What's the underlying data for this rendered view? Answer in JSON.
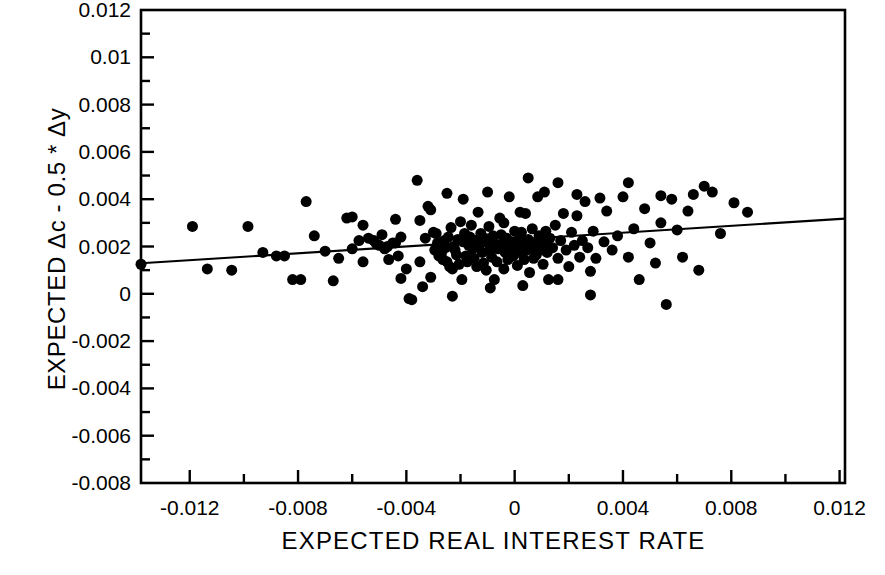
{
  "chart_data": {
    "type": "scatter",
    "title": "",
    "xlabel": "EXPECTED REAL INTEREST RATE",
    "ylabel": "EXPECTED Δc - 0.5 * Δy",
    "xlim": [
      -0.0138,
      0.0122
    ],
    "ylim": [
      -0.008,
      0.012
    ],
    "xticks": [
      -0.012,
      -0.008,
      -0.004,
      0,
      0.004,
      0.008,
      0.012
    ],
    "xticklabels": [
      "-0.012",
      "-0.008",
      "-0.004",
      "0",
      "0.004",
      "0.008",
      "0.012"
    ],
    "xtick_minor_step": 0.002,
    "yticks": [
      0.012,
      0.01,
      0.008,
      0.006,
      0.004,
      0.002,
      0,
      -0.002,
      -0.004,
      -0.006,
      -0.008
    ],
    "yticklabels": [
      "0.012",
      "0.01",
      "0.008",
      "0.006",
      "0.004",
      "0.002",
      "0",
      "-0.002",
      "-0.004",
      "-0.006",
      "-0.008"
    ],
    "ytick_minor_step": 0.001,
    "grid": false,
    "legend": null,
    "marker": {
      "shape": "circle",
      "color": "#000000",
      "size_px": 11
    },
    "frame_color": "#000000",
    "background": "#ffffff",
    "fit_line": {
      "label": "regression line",
      "color": "#000000",
      "slope": 0.0726,
      "intercept": 0.00229,
      "x_start": -0.0138,
      "y_start": 0.00129,
      "x_end": 0.0122,
      "y_end": 0.00318
    },
    "points": [
      [
        -0.0138,
        0.00125
      ],
      [
        -0.0119,
        0.00285
      ],
      [
        -0.01135,
        0.00105
      ],
      [
        -0.01045,
        0.001
      ],
      [
        -0.00985,
        0.00285
      ],
      [
        -0.0093,
        0.00175
      ],
      [
        -0.0088,
        0.0016
      ],
      [
        -0.0085,
        0.0016
      ],
      [
        -0.0082,
        0.0006
      ],
      [
        -0.0079,
        0.0006
      ],
      [
        -0.0077,
        0.0039
      ],
      [
        -0.0074,
        0.00245
      ],
      [
        -0.007,
        0.0018
      ],
      [
        -0.0067,
        0.00055
      ],
      [
        -0.0065,
        0.0015
      ],
      [
        -0.0062,
        0.0032
      ],
      [
        -0.006,
        0.00325
      ],
      [
        -0.00575,
        0.00225
      ],
      [
        -0.0056,
        0.00135
      ],
      [
        -0.0054,
        0.00235
      ],
      [
        -0.0052,
        0.00225
      ],
      [
        -0.0051,
        0.0021
      ],
      [
        -0.005,
        0.00205
      ],
      [
        -0.0049,
        0.0025
      ],
      [
        -0.0048,
        0.0019
      ],
      [
        -0.0047,
        0.002
      ],
      [
        -0.00465,
        0.00145
      ],
      [
        -0.0045,
        0.00215
      ],
      [
        -0.0044,
        0.00215
      ],
      [
        -0.0043,
        0.0016
      ],
      [
        -0.0042,
        0.00065
      ],
      [
        -0.004,
        0.00105
      ],
      [
        -0.0039,
        -0.0002
      ],
      [
        -0.0038,
        -0.00025
      ],
      [
        -0.0036,
        0.0048
      ],
      [
        -0.0035,
        0.00135
      ],
      [
        -0.0034,
        0.0003
      ],
      [
        -0.0033,
        0.00235
      ],
      [
        -0.0032,
        0.0037
      ],
      [
        -0.0031,
        0.00355
      ],
      [
        -0.003,
        0.0026
      ],
      [
        -0.00295,
        0.00185
      ],
      [
        -0.0029,
        0.00255
      ],
      [
        -0.00285,
        0.00215
      ],
      [
        -0.0028,
        0.0016
      ],
      [
        -0.00275,
        0.00205
      ],
      [
        -0.0027,
        0.00175
      ],
      [
        -0.00265,
        0.00145
      ],
      [
        -0.0026,
        0.00225
      ],
      [
        -0.00255,
        0.00195
      ],
      [
        -0.0025,
        0.00135
      ],
      [
        -0.00245,
        0.0024
      ],
      [
        -0.0024,
        0.00115
      ],
      [
        -0.00235,
        0.0028
      ],
      [
        -0.0023,
        0.00105
      ],
      [
        -0.00225,
        0.002
      ],
      [
        -0.0022,
        0.00185
      ],
      [
        -0.00215,
        0.00165
      ],
      [
        -0.0021,
        0.0023
      ],
      [
        -0.00205,
        0.00125
      ],
      [
        -0.002,
        0.00305
      ],
      [
        -0.00195,
        0.0006
      ],
      [
        -0.0019,
        0.0022
      ],
      [
        -0.00185,
        0.00255
      ],
      [
        -0.0018,
        0.0016
      ],
      [
        -0.00175,
        0.00135
      ],
      [
        -0.0017,
        0.00205
      ],
      [
        -0.00165,
        0.0024
      ],
      [
        -0.0016,
        0.0029
      ],
      [
        -0.00155,
        0.0019
      ],
      [
        -0.0015,
        0.0015
      ],
      [
        -0.00145,
        0.00225
      ],
      [
        -0.0014,
        0.00115
      ],
      [
        -0.00135,
        0.00345
      ],
      [
        -0.0013,
        0.00205
      ],
      [
        -0.00125,
        0.00255
      ],
      [
        -0.0012,
        0.00175
      ],
      [
        -0.00115,
        0.0013
      ],
      [
        -0.0011,
        0.00235
      ],
      [
        -0.00105,
        0.001
      ],
      [
        -0.001,
        0.00215
      ],
      [
        -0.00095,
        0.00285
      ],
      [
        -0.0009,
        0.00185
      ],
      [
        -0.00085,
        0.00155
      ],
      [
        -0.0008,
        0.00245
      ],
      [
        -0.00075,
        0.0006
      ],
      [
        -0.0007,
        0.0021
      ],
      [
        -0.00065,
        0.00135
      ],
      [
        -0.0006,
        0.0019
      ],
      [
        -0.00055,
        0.0032
      ],
      [
        -0.0005,
        0.0025
      ],
      [
        -0.00045,
        0.00205
      ],
      [
        -0.0004,
        0.00105
      ],
      [
        -0.00035,
        0.00175
      ],
      [
        -0.0003,
        0.00235
      ],
      [
        -0.00025,
        0.00145
      ],
      [
        -0.0002,
        0.0041
      ],
      [
        -0.00015,
        0.00195
      ],
      [
        -0.0001,
        0.0022
      ],
      [
        -5e-05,
        0.0016
      ],
      [
        0.0,
        0.00265
      ],
      [
        5e-05,
        0.00195
      ],
      [
        0.0001,
        0.0012
      ],
      [
        0.00015,
        0.0023
      ],
      [
        0.0002,
        0.00175
      ],
      [
        0.00025,
        0.0026
      ],
      [
        0.0003,
        0.00205
      ],
      [
        0.00035,
        0.00145
      ],
      [
        0.0004,
        0.0034
      ],
      [
        0.00045,
        0.00185
      ],
      [
        0.0005,
        0.0023
      ],
      [
        0.00055,
        0.0009
      ],
      [
        0.0006,
        0.00195
      ],
      [
        0.00065,
        0.00275
      ],
      [
        0.0007,
        0.0015
      ],
      [
        0.00075,
        0.00215
      ],
      [
        0.0008,
        0.00165
      ],
      [
        0.00085,
        0.0041
      ],
      [
        0.0009,
        0.00245
      ],
      [
        0.00095,
        0.00185
      ],
      [
        0.001,
        0.0023
      ],
      [
        0.00105,
        0.00125
      ],
      [
        0.0011,
        0.00205
      ],
      [
        0.00115,
        0.00265
      ],
      [
        0.0012,
        0.00175
      ],
      [
        0.00125,
        0.0006
      ],
      [
        0.0013,
        0.00235
      ],
      [
        0.0014,
        0.00195
      ],
      [
        0.0015,
        0.0029
      ],
      [
        0.0016,
        0.0015
      ],
      [
        0.0017,
        0.00225
      ],
      [
        0.0018,
        0.0034
      ],
      [
        0.0019,
        0.00185
      ],
      [
        0.002,
        0.00115
      ],
      [
        0.0021,
        0.0026
      ],
      [
        0.0022,
        0.00205
      ],
      [
        0.0023,
        0.0033
      ],
      [
        0.0024,
        0.00155
      ],
      [
        0.0025,
        0.00225
      ],
      [
        0.0026,
        0.0039
      ],
      [
        0.0027,
        0.00195
      ],
      [
        0.0028,
        0.00095
      ],
      [
        0.0029,
        0.00265
      ],
      [
        0.003,
        0.0015
      ],
      [
        0.00315,
        0.00405
      ],
      [
        0.0033,
        0.0022
      ],
      [
        0.0034,
        0.0035
      ],
      [
        0.0036,
        0.00185
      ],
      [
        0.0038,
        0.00245
      ],
      [
        0.004,
        0.0041
      ],
      [
        0.0042,
        0.00155
      ],
      [
        0.0044,
        0.00275
      ],
      [
        0.0046,
        0.0006
      ],
      [
        0.0048,
        0.0036
      ],
      [
        0.005,
        0.00215
      ],
      [
        0.0052,
        0.0013
      ],
      [
        0.0054,
        0.003
      ],
      [
        0.0056,
        -0.00045
      ],
      [
        0.0058,
        0.004
      ],
      [
        0.006,
        0.0027
      ],
      [
        0.0062,
        0.00155
      ],
      [
        0.0064,
        0.0035
      ],
      [
        0.0068,
        0.001
      ],
      [
        0.007,
        0.00455
      ],
      [
        0.0073,
        0.0043
      ],
      [
        0.0076,
        0.00255
      ],
      [
        0.0081,
        0.00385
      ],
      [
        0.0086,
        0.00345
      ],
      [
        0.0042,
        0.0047
      ],
      [
        -0.006,
        0.0019
      ],
      [
        -0.0056,
        0.0029
      ],
      [
        0.0016,
        0.0047
      ],
      [
        0.0005,
        0.0049
      ],
      [
        0.0002,
        0.00345
      ],
      [
        -0.0042,
        0.0024
      ],
      [
        -0.0035,
        0.0031
      ],
      [
        -0.0025,
        0.00425
      ],
      [
        -0.0019,
        0.004
      ],
      [
        -0.001,
        0.0043
      ],
      [
        0.0011,
        0.0043
      ],
      [
        -0.0031,
        0.0007
      ],
      [
        -0.0023,
        -0.0001
      ],
      [
        -0.0009,
        0.00025
      ],
      [
        0.0003,
        0.00035
      ],
      [
        0.0016,
        0.0006
      ],
      [
        0.0028,
        -5e-05
      ],
      [
        -0.0044,
        0.00315
      ],
      [
        0.0023,
        0.0042
      ],
      [
        -0.0004,
        0.003
      ],
      [
        0.0066,
        0.0042
      ],
      [
        0.0054,
        0.00415
      ]
    ]
  }
}
